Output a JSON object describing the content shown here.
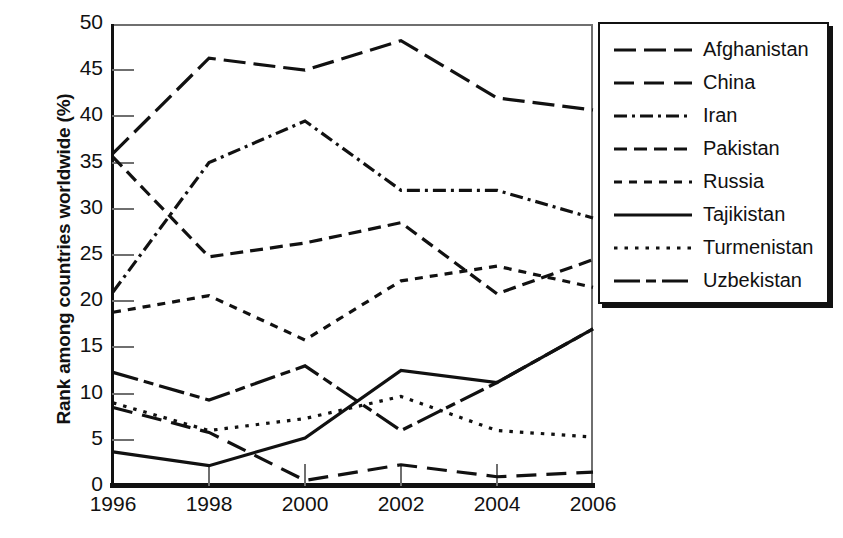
{
  "chart_data": {
    "type": "line",
    "title": "",
    "xlabel": "",
    "ylabel": "Rank among countries worldwide (%)",
    "categories": [
      1996,
      1998,
      2000,
      2002,
      2004,
      2006
    ],
    "xtick_labels": [
      "1996",
      "1998",
      "2000",
      "2002",
      "2004",
      "2006"
    ],
    "ytick_labels": [
      "0",
      "5",
      "10",
      "15",
      "20",
      "25",
      "30",
      "35",
      "40",
      "45",
      "50"
    ],
    "ylim": [
      0,
      50
    ],
    "ytick_step": 5,
    "grid": true,
    "legend_position": "right-outside",
    "series": [
      {
        "name": "Afghanistan",
        "dash": "long-dash-dot",
        "values": [
          36.0,
          46.3,
          45.0,
          48.2,
          42.0,
          40.7
        ]
      },
      {
        "name": "China",
        "dash": "long-dash",
        "values": [
          8.5,
          5.8,
          0.6,
          2.3,
          1.0,
          1.5
        ]
      },
      {
        "name": "Iran",
        "dash": "dash-dot",
        "values": [
          21.0,
          35.0,
          39.5,
          32.0,
          32.0,
          29.0
        ]
      },
      {
        "name": "Pakistan",
        "dash": "medium-dash",
        "values": [
          35.6,
          24.8,
          26.3,
          28.5,
          20.8,
          24.5
        ]
      },
      {
        "name": "Russia",
        "dash": "short-dash",
        "values": [
          18.8,
          20.6,
          15.8,
          22.2,
          23.8,
          21.5
        ]
      },
      {
        "name": "Tajikistan",
        "dash": "solid",
        "values": [
          3.7,
          2.2,
          5.2,
          12.5,
          11.2,
          17.0
        ]
      },
      {
        "name": "Turmenistan",
        "dash": "dotted",
        "values": [
          9.0,
          6.0,
          7.3,
          9.7,
          6.0,
          5.3
        ]
      },
      {
        "name": "Uzbekistan",
        "dash": "dash-dot-long",
        "values": [
          12.3,
          9.3,
          13.0,
          6.0,
          11.2,
          17.0
        ]
      }
    ],
    "colors": {
      "line": "#111111",
      "grid": "#6f6f6f",
      "axis": "#111111",
      "background": "#ffffff"
    }
  },
  "legend": {
    "entries": [
      {
        "label": "Afghanistan"
      },
      {
        "label": "China"
      },
      {
        "label": "Iran"
      },
      {
        "label": "Pakistan"
      },
      {
        "label": "Russia"
      },
      {
        "label": "Tajikistan"
      },
      {
        "label": "Turmenistan"
      },
      {
        "label": "Uzbekistan"
      }
    ]
  }
}
